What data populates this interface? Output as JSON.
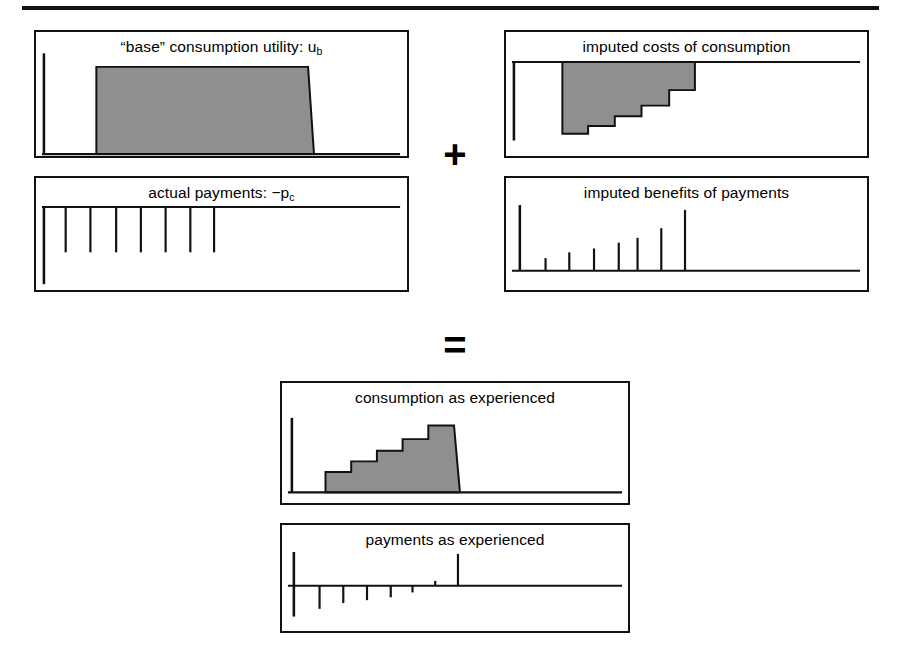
{
  "figure": {
    "width": 899,
    "height": 663,
    "top_rule": true,
    "background_color": "#ffffff",
    "ink_color": "#111111",
    "fill_color": "#8f8f8f",
    "operators": [
      {
        "name": "plus",
        "symbol": "+"
      },
      {
        "name": "equals",
        "symbol": "="
      }
    ]
  },
  "panels": [
    {
      "id": "base-consumption-utility",
      "title_text": "“base” consumption utility: u",
      "title_sub": "b",
      "plot_type": "area",
      "axis_position": "baseline",
      "description": "flat shaded plateau above the horizontal axis"
    },
    {
      "id": "actual-payments",
      "title_text": "actual payments: −p",
      "title_sub": "c",
      "plot_type": "bars-down",
      "axis_position": "top",
      "bar_count": 8,
      "bar_values": [
        -1,
        -1,
        -1,
        -1,
        -1,
        -1,
        -1,
        -1
      ],
      "description": "eight equal-length downward payment spikes"
    },
    {
      "id": "imputed-costs-of-consumption",
      "title_text": "imputed costs of consumption",
      "title_sub": "",
      "plot_type": "area-down",
      "axis_position": "top",
      "description": "shaded sawtooth region below the axis, deepest at the left, stepping up to the right"
    },
    {
      "id": "imputed-benefits-of-payments",
      "title_text": "imputed benefits of payments",
      "title_sub": "",
      "plot_type": "bars-up",
      "axis_position": "baseline",
      "bar_count": 7,
      "bar_values": [
        0.18,
        0.3,
        0.38,
        0.5,
        0.62,
        0.86,
        1.6
      ],
      "description": "seven upward spikes increasing in height toward the right"
    },
    {
      "id": "consumption-as-experienced",
      "title_text": "consumption as experienced",
      "title_sub": "",
      "plot_type": "area-staircase",
      "axis_position": "baseline",
      "step_count": 5,
      "description": "ascending shaded staircase rising to a tall plateau"
    },
    {
      "id": "payments-as-experienced",
      "title_text": "payments as experienced",
      "title_sub": "",
      "plot_type": "bars-mixed",
      "axis_position": "middle",
      "bar_values": [
        -0.62,
        -0.46,
        -0.38,
        -0.3,
        -0.18,
        0.07,
        1.0
      ],
      "description": "five shrinking downward spikes, a tiny upward tick, then one tall upward spike"
    }
  ]
}
